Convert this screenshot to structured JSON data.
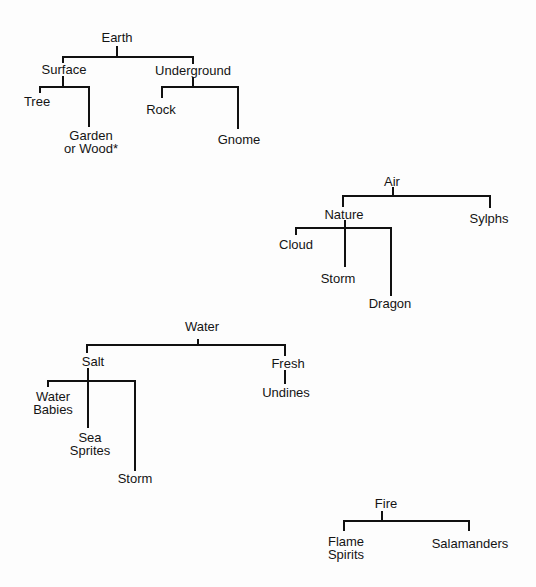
{
  "diagram": {
    "type": "tree-diagram",
    "trees": [
      {
        "name": "earth",
        "nodes": [
          {
            "id": "earth",
            "lines": [
              "Earth"
            ],
            "x": 117,
            "y": 31
          },
          {
            "id": "surface",
            "lines": [
              "Surface"
            ],
            "x": 64,
            "y": 63
          },
          {
            "id": "underground",
            "lines": [
              "Underground"
            ],
            "x": 193,
            "y": 64
          },
          {
            "id": "tree",
            "lines": [
              "Tree"
            ],
            "x": 37,
            "y": 95
          },
          {
            "id": "garden-or-wood",
            "lines": [
              "Garden",
              "or Wood*"
            ],
            "x": 91,
            "y": 130
          },
          {
            "id": "rock",
            "lines": [
              "Rock"
            ],
            "x": 161,
            "y": 103
          },
          {
            "id": "gnome",
            "lines": [
              "Gnome"
            ],
            "x": 239,
            "y": 133
          }
        ],
        "edges": [
          [
            117,
            47,
            117,
            57
          ],
          [
            63,
            57,
            193,
            57
          ],
          [
            63,
            57,
            63,
            62
          ],
          [
            193,
            57,
            193,
            63
          ],
          [
            63,
            77,
            63,
            87
          ],
          [
            40,
            87,
            89,
            87
          ],
          [
            40,
            87,
            40,
            92
          ],
          [
            89,
            87,
            89,
            126
          ],
          [
            193,
            78,
            193,
            87
          ],
          [
            162,
            87,
            238,
            87
          ],
          [
            162,
            87,
            162,
            97
          ],
          [
            238,
            87,
            238,
            128
          ]
        ]
      },
      {
        "name": "air",
        "nodes": [
          {
            "id": "air",
            "lines": [
              "Air"
            ],
            "x": 392,
            "y": 175
          },
          {
            "id": "nature",
            "lines": [
              "Nature"
            ],
            "x": 344,
            "y": 208
          },
          {
            "id": "sylphs",
            "lines": [
              "Sylphs"
            ],
            "x": 489,
            "y": 212
          },
          {
            "id": "cloud",
            "lines": [
              "Cloud"
            ],
            "x": 296,
            "y": 238
          },
          {
            "id": "storm-air",
            "lines": [
              "Storm"
            ],
            "x": 338,
            "y": 272
          },
          {
            "id": "dragon",
            "lines": [
              "Dragon"
            ],
            "x": 390,
            "y": 297
          }
        ],
        "edges": [
          [
            393,
            188,
            393,
            196
          ],
          [
            343,
            196,
            490,
            196
          ],
          [
            343,
            196,
            343,
            206
          ],
          [
            490,
            196,
            490,
            207
          ],
          [
            345,
            221,
            345,
            266
          ],
          [
            296,
            228,
            391,
            228
          ],
          [
            296,
            228,
            296,
            234
          ],
          [
            391,
            228,
            391,
            295
          ]
        ]
      },
      {
        "name": "water",
        "nodes": [
          {
            "id": "water",
            "lines": [
              "Water"
            ],
            "x": 202,
            "y": 320
          },
          {
            "id": "salt",
            "lines": [
              "Salt"
            ],
            "x": 93,
            "y": 355
          },
          {
            "id": "fresh",
            "lines": [
              "Fresh"
            ],
            "x": 288,
            "y": 357
          },
          {
            "id": "water-babies",
            "lines": [
              "Water",
              "Babies"
            ],
            "x": 53,
            "y": 391
          },
          {
            "id": "sea-sprites",
            "lines": [
              "Sea",
              "Sprites"
            ],
            "x": 90,
            "y": 432
          },
          {
            "id": "storm-water",
            "lines": [
              "Storm"
            ],
            "x": 135,
            "y": 472
          },
          {
            "id": "undines",
            "lines": [
              "Undines"
            ],
            "x": 286,
            "y": 386
          }
        ],
        "edges": [
          [
            198,
            340,
            198,
            345
          ],
          [
            87,
            345,
            285,
            345
          ],
          [
            87,
            345,
            87,
            352
          ],
          [
            285,
            345,
            285,
            355
          ],
          [
            88,
            369,
            88,
            427
          ],
          [
            48,
            381,
            135,
            381
          ],
          [
            48,
            381,
            48,
            386
          ],
          [
            135,
            381,
            135,
            470
          ],
          [
            285,
            371,
            285,
            383
          ]
        ]
      },
      {
        "name": "fire",
        "nodes": [
          {
            "id": "fire",
            "lines": [
              "Fire"
            ],
            "x": 386,
            "y": 497
          },
          {
            "id": "flame-spirits",
            "lines": [
              "Flame",
              "Spirits"
            ],
            "x": 346,
            "y": 536
          },
          {
            "id": "salamanders",
            "lines": [
              "Salamanders"
            ],
            "x": 470,
            "y": 537
          }
        ],
        "edges": [
          [
            382,
            512,
            382,
            521
          ],
          [
            344,
            521,
            469,
            521
          ],
          [
            344,
            521,
            344,
            530
          ],
          [
            469,
            521,
            469,
            530
          ]
        ]
      }
    ]
  },
  "labels": {
    "earth": "Earth",
    "surface": "Surface",
    "underground": "Underground",
    "tree": "Tree",
    "garden_or_wood": [
      "Garden",
      "or Wood*"
    ],
    "rock": "Rock",
    "gnome": "Gnome",
    "air": "Air",
    "nature": "Nature",
    "sylphs": "Sylphs",
    "cloud": "Cloud",
    "storm_air": "Storm",
    "dragon": "Dragon",
    "water": "Water",
    "salt": "Salt",
    "fresh": "Fresh",
    "water_babies": [
      "Water",
      "Babies"
    ],
    "sea_sprites": [
      "Sea",
      "Sprites"
    ],
    "storm_water": "Storm",
    "undines": "Undines",
    "fire": "Fire",
    "flame_spirits": [
      "Flame",
      "Spirits"
    ],
    "salamanders": "Salamanders"
  },
  "colors": {
    "line": "#111111",
    "text": "#141414",
    "background": "#fdfdfd"
  }
}
